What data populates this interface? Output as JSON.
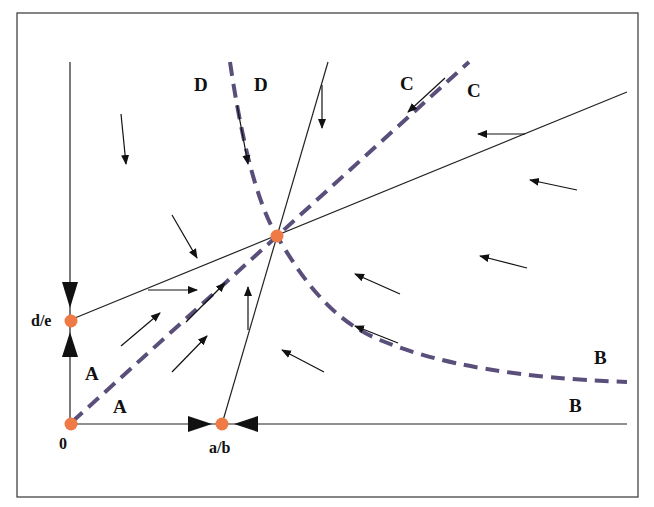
{
  "diagram": {
    "type": "phase-plane",
    "colors": {
      "line": "#222222",
      "dashed": "#5a4f7a",
      "equilibrium": "#f07a45",
      "frame": "#444444",
      "background": "#ffffff"
    },
    "equilibria": [
      {
        "id": "origin",
        "label": "0",
        "x": 70,
        "y": 424
      },
      {
        "id": "a-over-b",
        "label": "a/b",
        "x": 222,
        "y": 424
      },
      {
        "id": "d-over-e",
        "label": "d/e",
        "x": 70,
        "y": 320
      },
      {
        "id": "interior",
        "label": "",
        "x": 277,
        "y": 236
      }
    ],
    "region_labels": {
      "A1": "A",
      "A2": "A",
      "B1": "B",
      "B2": "B",
      "C1": "C",
      "C2": "C",
      "D1": "D",
      "D2": "D"
    },
    "axis_labels": {
      "origin": "0",
      "x_intercept": "a/b",
      "y_intercept": "d/e"
    }
  }
}
